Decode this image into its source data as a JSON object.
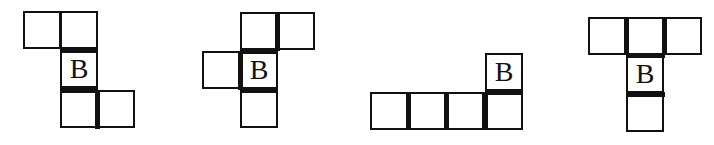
{
  "figures": [
    {
      "id": "net-1",
      "cell_size": 38,
      "cells": [
        {
          "x": 23,
          "y": 11,
          "label": ""
        },
        {
          "x": 60,
          "y": 11,
          "label": ""
        },
        {
          "x": 60,
          "y": 50,
          "label": "B"
        },
        {
          "x": 60,
          "y": 90,
          "label": ""
        },
        {
          "x": 97,
          "y": 90,
          "label": ""
        }
      ],
      "thick_edges": [
        {
          "x": 60,
          "y": 48,
          "w": 38,
          "h": 5
        },
        {
          "x": 60,
          "y": 88,
          "w": 38,
          "h": 5
        },
        {
          "x": 95,
          "y": 90,
          "w": 5,
          "h": 39
        }
      ]
    },
    {
      "id": "net-2",
      "cell_size": 38,
      "cells": [
        {
          "x": 240,
          "y": 12,
          "label": ""
        },
        {
          "x": 277,
          "y": 12,
          "label": ""
        },
        {
          "x": 202,
          "y": 51,
          "label": ""
        },
        {
          "x": 240,
          "y": 51,
          "label": "B"
        },
        {
          "x": 240,
          "y": 90,
          "label": ""
        }
      ],
      "thick_edges": [
        {
          "x": 275,
          "y": 12,
          "w": 5,
          "h": 39
        },
        {
          "x": 240,
          "y": 49,
          "w": 38,
          "h": 5
        },
        {
          "x": 238,
          "y": 51,
          "w": 5,
          "h": 39
        },
        {
          "x": 240,
          "y": 88,
          "w": 38,
          "h": 5
        }
      ]
    },
    {
      "id": "net-3",
      "cell_size": 38,
      "cells": [
        {
          "x": 485,
          "y": 53,
          "label": "B"
        },
        {
          "x": 370,
          "y": 92,
          "label": ""
        },
        {
          "x": 408,
          "y": 92,
          "label": ""
        },
        {
          "x": 446,
          "y": 92,
          "label": ""
        },
        {
          "x": 485,
          "y": 92,
          "label": ""
        }
      ],
      "thick_edges": [
        {
          "x": 485,
          "y": 90,
          "w": 38,
          "h": 5
        },
        {
          "x": 406,
          "y": 92,
          "w": 5,
          "h": 38
        },
        {
          "x": 444,
          "y": 92,
          "w": 5,
          "h": 38
        },
        {
          "x": 483,
          "y": 92,
          "w": 5,
          "h": 38
        }
      ]
    },
    {
      "id": "net-4",
      "cell_size": 38,
      "cells": [
        {
          "x": 588,
          "y": 17,
          "label": ""
        },
        {
          "x": 626,
          "y": 17,
          "label": ""
        },
        {
          "x": 664,
          "y": 17,
          "label": ""
        },
        {
          "x": 626,
          "y": 55,
          "label": "B"
        },
        {
          "x": 626,
          "y": 94,
          "label": ""
        }
      ],
      "thick_edges": [
        {
          "x": 624,
          "y": 17,
          "w": 5,
          "h": 38
        },
        {
          "x": 662,
          "y": 17,
          "w": 5,
          "h": 38
        },
        {
          "x": 626,
          "y": 53,
          "w": 39,
          "h": 5
        },
        {
          "x": 626,
          "y": 92,
          "w": 39,
          "h": 5
        }
      ]
    }
  ]
}
